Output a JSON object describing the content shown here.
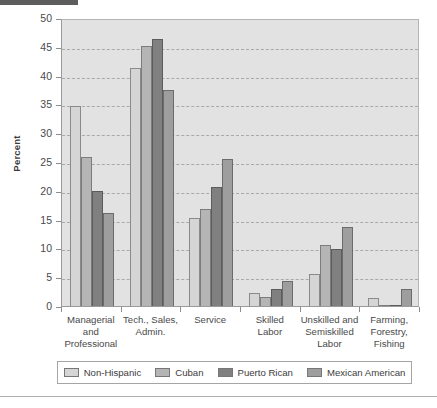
{
  "chart_data": {
    "type": "bar",
    "title": "",
    "xlabel": "",
    "ylabel": "Percent",
    "ylim": [
      0,
      50
    ],
    "yticks": [
      0,
      5,
      10,
      15,
      20,
      25,
      30,
      35,
      40,
      45,
      50
    ],
    "ytick_labels": [
      "0",
      "5",
      "10",
      "15",
      "20",
      "25",
      "30",
      "35",
      "40",
      "45",
      "50"
    ],
    "grid": true,
    "legend_position": "bottom",
    "categories": [
      "Managerial and Professional",
      "Tech., Sales, Admin.",
      "Service",
      "Skilled Labor",
      "Unskilled and Semiskilled Labor",
      "Farming, Forestry, Fishing"
    ],
    "category_label_lines": [
      [
        "Managerial",
        "and",
        "Professional"
      ],
      [
        "Tech., Sales,",
        "Admin."
      ],
      [
        "Service"
      ],
      [
        "Skilled",
        "Labor"
      ],
      [
        "Unskilled and",
        "Semiskilled",
        "Labor"
      ],
      [
        "Farming,",
        "Forestry,",
        "Fishing"
      ]
    ],
    "series": [
      {
        "name": "Non-Hispanic",
        "color": "#d5d5d5",
        "values": [
          34.7,
          41.3,
          15.3,
          2.2,
          5.5,
          1.4
        ]
      },
      {
        "name": "Cuban",
        "color": "#b5b5b5",
        "values": [
          25.8,
          45.2,
          16.8,
          1.5,
          10.6,
          0.2
        ]
      },
      {
        "name": "Puerto Rican",
        "color": "#808080",
        "values": [
          20.0,
          46.3,
          20.7,
          2.9,
          9.9,
          0.0
        ]
      },
      {
        "name": "Mexican American",
        "color": "#9e9e9e",
        "values": [
          16.2,
          37.5,
          25.6,
          4.3,
          13.7,
          2.9
        ]
      }
    ]
  },
  "legend": {
    "items": [
      {
        "label": "Non-Hispanic"
      },
      {
        "label": "Cuban"
      },
      {
        "label": "Puerto Rican"
      },
      {
        "label": "Mexican American"
      }
    ]
  }
}
